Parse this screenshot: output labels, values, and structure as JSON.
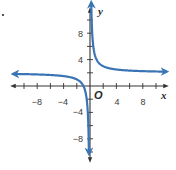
{
  "chart_data": {
    "type": "line",
    "title": "",
    "xlabel": "x",
    "ylabel": "y",
    "origin_label": "O",
    "function": "y = 2/x + 2",
    "xlim": [
      -11,
      11
    ],
    "ylim": [
      -11,
      11
    ],
    "x_ticks": [
      -10,
      -8,
      -6,
      -4,
      -2,
      2,
      4,
      6,
      8,
      10
    ],
    "y_ticks": [
      -10,
      -8,
      -6,
      -4,
      -2,
      2,
      4,
      6,
      8,
      10
    ],
    "x_tick_labels": [
      "-8",
      "-4",
      "4",
      "8"
    ],
    "y_tick_labels": [
      "8",
      "4",
      "-4",
      "-8"
    ],
    "asymptotes": {
      "vertical": 0,
      "horizontal": 2
    },
    "grid": false,
    "series": [
      {
        "name": "left-branch",
        "x": [
          -10.5,
          -8,
          -6,
          -4,
          -2,
          -1.5,
          -1,
          -0.5,
          -0.25,
          -0.2
        ],
        "y": [
          1.81,
          1.75,
          1.67,
          1.5,
          1,
          0.67,
          0,
          -2,
          -6,
          -8
        ]
      },
      {
        "name": "right-branch",
        "x": [
          0.2,
          0.25,
          0.5,
          1,
          2,
          4,
          6,
          8,
          10.5
        ],
        "y": [
          12,
          10,
          6,
          4,
          3,
          2.5,
          2.33,
          2.25,
          2.19
        ]
      }
    ],
    "curve_color": "#3a74b4",
    "axis_color": "#333333"
  },
  "problem_marker": "•"
}
